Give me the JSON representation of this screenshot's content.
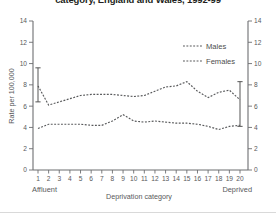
{
  "chart_data": {
    "type": "line",
    "title": "category, England and Wales, 1992-99",
    "xlabel": "Deprivation category",
    "ylabel": "Rate per 100,000",
    "ylim": [
      0,
      14
    ],
    "yticks": [
      0,
      2,
      4,
      6,
      8,
      10,
      12,
      14
    ],
    "ytick_labels": [
      "0",
      "2",
      "4",
      "6",
      "8",
      "10",
      "12",
      "14"
    ],
    "dual_y_axis": true,
    "grid": false,
    "legend_position": "top-right",
    "categories": [
      1,
      2,
      3,
      4,
      5,
      6,
      7,
      8,
      9,
      10,
      11,
      12,
      13,
      14,
      15,
      16,
      17,
      18,
      19,
      20
    ],
    "xtick_labels": [
      "1",
      "2",
      "3",
      "4",
      "5",
      "6",
      "7",
      "8",
      "9",
      "10",
      "11",
      "12",
      "13",
      "14",
      "15",
      "16",
      "17",
      "18",
      "19",
      "20"
    ],
    "axis_end_labels": {
      "left": "Affluent",
      "right": "Deprived"
    },
    "series": [
      {
        "name": "Males",
        "values": [
          7.9,
          6.1,
          6.4,
          6.7,
          7.0,
          7.1,
          7.1,
          7.1,
          7.0,
          6.9,
          7.0,
          7.4,
          7.8,
          7.9,
          8.3,
          7.4,
          6.8,
          7.3,
          7.5,
          6.6
        ],
        "error_bars": [
          {
            "category": 1,
            "low": 6.4,
            "high": 9.6
          },
          {
            "category": 20,
            "low": 4.1,
            "high": 8.3
          }
        ]
      },
      {
        "name": "Females",
        "values": [
          3.9,
          4.3,
          4.3,
          4.3,
          4.3,
          4.2,
          4.2,
          4.6,
          5.2,
          4.6,
          4.5,
          4.6,
          4.5,
          4.4,
          4.4,
          4.3,
          4.1,
          3.8,
          4.1,
          4.2
        ]
      }
    ]
  }
}
